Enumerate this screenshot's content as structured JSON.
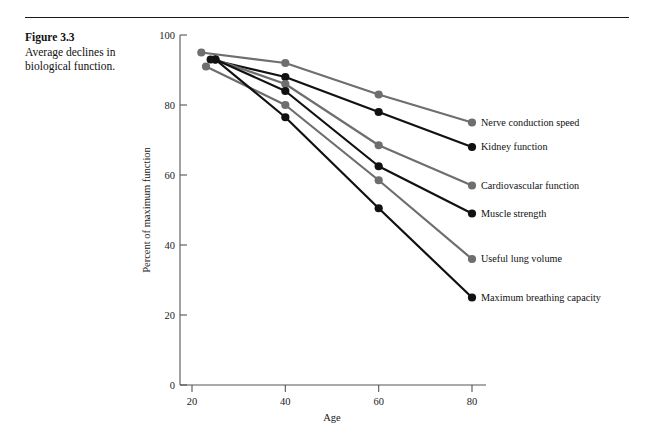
{
  "figure": {
    "number_label": "Figure 3.3",
    "caption": "Average declines in biological function."
  },
  "axes": {
    "x_title": "Age",
    "y_title": "Percent of maximum function",
    "x_ticks": [
      "20",
      "40",
      "60",
      "80"
    ],
    "y_ticks": [
      "0",
      "20",
      "40",
      "60",
      "80",
      "100"
    ]
  },
  "labels": {
    "nerve": "Nerve conduction speed",
    "kidney": "Kidney function",
    "cardio": "Cardiovascular function",
    "muscle": "Muscle strength",
    "lung": "Useful lung volume",
    "breathing": "Maximum breathing capacity"
  },
  "chart_data": {
    "type": "line",
    "title": "Average declines in biological function.",
    "xlabel": "Age",
    "ylabel": "Percent of maximum function",
    "xlim": [
      20,
      80
    ],
    "ylim": [
      0,
      100
    ],
    "x_ticks": [
      20,
      40,
      60,
      80
    ],
    "y_ticks": [
      0,
      20,
      40,
      60,
      80,
      100
    ],
    "grid": false,
    "legend": "inline-right-of-endpoint",
    "x": [
      20,
      40,
      60,
      80
    ],
    "series": [
      {
        "name": "Nerve conduction speed",
        "color": "#6e6e6e",
        "x": [
          22,
          40,
          60,
          80
        ],
        "values": [
          95,
          92,
          83,
          75
        ]
      },
      {
        "name": "Kidney function",
        "color": "#111111",
        "x": [
          24,
          40,
          60,
          80
        ],
        "values": [
          93,
          88,
          78,
          68
        ]
      },
      {
        "name": "Cardiovascular function",
        "color": "#6e6e6e",
        "x": [
          25,
          40,
          60,
          80
        ],
        "values": [
          93,
          86,
          68.5,
          57
        ]
      },
      {
        "name": "Muscle strength",
        "color": "#111111",
        "x": [
          25,
          40,
          60,
          80
        ],
        "values": [
          93,
          84,
          62.5,
          49
        ]
      },
      {
        "name": "Useful lung volume",
        "color": "#6e6e6e",
        "x": [
          23,
          40,
          60,
          80
        ],
        "values": [
          91,
          80,
          58.5,
          36
        ]
      },
      {
        "name": "Maximum breathing capacity",
        "color": "#111111",
        "x": [
          25,
          40,
          60,
          80
        ],
        "values": [
          93,
          76.5,
          50.5,
          25
        ]
      }
    ]
  }
}
